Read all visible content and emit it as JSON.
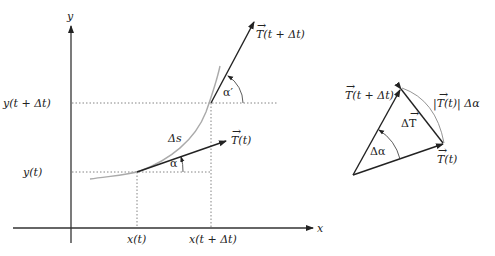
{
  "diagram": {
    "left": {
      "axes": {
        "x_label": "x",
        "y_label": "y"
      },
      "ticks": {
        "x_t": "x(t)",
        "x_t_dt": "x(t + Δt)",
        "y_t": "y(t)",
        "y_t_dt": "y(t + Δt)"
      },
      "arc_length_label": "Δs",
      "angle_alpha": "α",
      "angle_alpha_prime": "α′",
      "vector_T_t": "T(t)",
      "vector_T_t_dt": "T(t + Δt)"
    },
    "right": {
      "vector_T_t_dt": "T(t + Δt)",
      "vector_T_t": "T(t)",
      "delta_T": "ΔT",
      "delta_alpha": "Δα",
      "arc_label": "|T(t)| Δα"
    }
  }
}
